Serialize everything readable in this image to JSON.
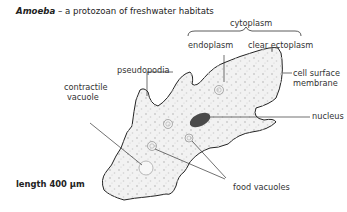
{
  "title": {
    "name": "Amoeba",
    "rest": " – a protozoan of freshwater habitats"
  },
  "labels": {
    "cytoplasm": "cytoplasm",
    "endoplasm": "endoplasm",
    "ectoplasm": "clear ectoplasm",
    "membrane_1": "cell surface",
    "membrane_2": "membrane",
    "pseudopodia": "pseudopodia",
    "contractile_1": "contractile",
    "contractile_2": "vacuole",
    "nucleus": "nucleus",
    "food_vacuoles": "food vacuoles"
  },
  "scale": {
    "label": "length 400 μm"
  },
  "colors": {
    "outline": "#222222",
    "cytoplasm_fill": "#f1f1f1",
    "granules": "#c8c8c8",
    "nucleus": "#4a4a4a"
  }
}
